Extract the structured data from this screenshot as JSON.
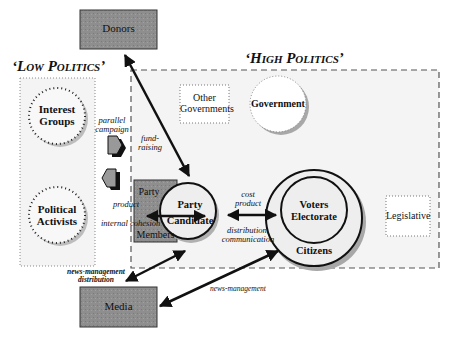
{
  "title_low": "‘Low Politics’",
  "title_high": "‘High Politics’",
  "nodes": {
    "donors": "Donors",
    "media": "Media",
    "interest_groups": [
      "Interest",
      "Groups"
    ],
    "political_activists": [
      "Political",
      "Activists"
    ],
    "other_governments": [
      "Other",
      "Governments"
    ],
    "government": "Government",
    "party_members_top": "Party",
    "party_members_bottom": "Members",
    "party_candidate": [
      "Party",
      "Candidate"
    ],
    "voters_electorate": [
      "Voters",
      "Electorate"
    ],
    "citizens": "Citizens",
    "legislative": "Legislative"
  },
  "edge_labels": {
    "parallel_campaign": [
      "parallel",
      "campaign"
    ],
    "fund_raising": [
      "fund-",
      "raising"
    ],
    "product": "product",
    "internal_cohesion": "internal cohesion",
    "cost_product": [
      "cost",
      "product"
    ],
    "distribution_communication": [
      "distribution,",
      "communication"
    ],
    "news_management_distribution": [
      "news-management",
      "distribution"
    ],
    "news_management": "news-management"
  },
  "colors": {
    "grey_box": "#8e8e8e",
    "panel_bg": "#f4f4f4",
    "circle_fill": "#eeeeee",
    "arrow": "#111111"
  }
}
